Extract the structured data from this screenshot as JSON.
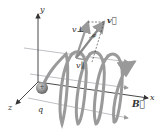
{
  "figure": {
    "axes": {
      "x": "x",
      "y": "y",
      "z": "z"
    },
    "labels": {
      "velocity": "v⃗",
      "v_perp": "v⊥",
      "v_par": "v∥",
      "angle": "φ",
      "charge": "q",
      "field": "B⃗",
      "charge_sign": "+"
    },
    "colors": {
      "helix": "#9a9a9a",
      "particle": "#8a8a8a",
      "field_lines": "#b0b0b8",
      "axes": "#333333"
    }
  }
}
